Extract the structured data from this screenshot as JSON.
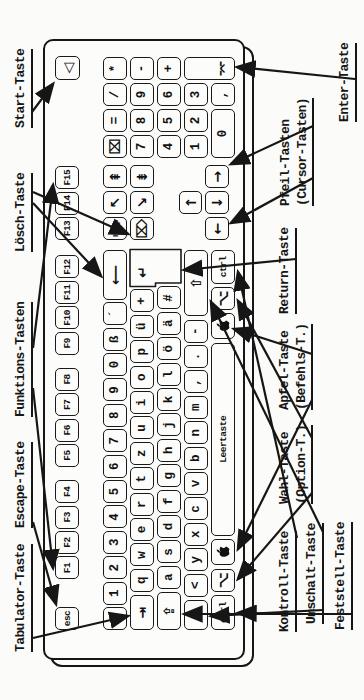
{
  "figure": {
    "kind": "keyboard-diagram",
    "paper_color": "#fbfbf9",
    "ink_color": "#161616"
  },
  "keyboard": {
    "space_label": "Leertaste",
    "keys": [
      {
        "n": "esc",
        "t": "esc",
        "x": 70,
        "y": 55,
        "s": "s"
      },
      {
        "n": "f1",
        "t": "F1",
        "x": 120.5,
        "y": 55,
        "s": "s"
      },
      {
        "n": "f2",
        "t": "F2",
        "x": 145.9,
        "y": 55,
        "s": "s"
      },
      {
        "n": "f3",
        "t": "F3",
        "x": 171.3,
        "y": 55,
        "s": "s"
      },
      {
        "n": "f4",
        "t": "F4",
        "x": 196.7,
        "y": 55,
        "s": "s"
      },
      {
        "n": "f5",
        "t": "F5",
        "x": 232.9,
        "y": 55,
        "s": "s"
      },
      {
        "n": "f6",
        "t": "F6",
        "x": 258.3,
        "y": 55,
        "s": "s"
      },
      {
        "n": "f7",
        "t": "F7",
        "x": 283.7,
        "y": 55,
        "s": "s"
      },
      {
        "n": "f8",
        "t": "F8",
        "x": 309.1,
        "y": 55,
        "s": "s"
      },
      {
        "n": "f9",
        "t": "F9",
        "x": 345.3,
        "y": 55,
        "s": "s"
      },
      {
        "n": "f10",
        "t": "F10",
        "x": 370.7,
        "y": 55,
        "s": "s"
      },
      {
        "n": "f11",
        "t": "F11",
        "x": 396.1,
        "y": 55,
        "s": "s"
      },
      {
        "n": "f12",
        "t": "F12",
        "x": 421.5,
        "y": 55,
        "s": "s"
      },
      {
        "n": "f13",
        "t": "F13",
        "x": 460,
        "y": 55,
        "s": "s"
      },
      {
        "n": "f14",
        "t": "F14",
        "x": 485.4,
        "y": 55,
        "s": "s"
      },
      {
        "n": "f15",
        "t": "F15",
        "x": 510.8,
        "y": 55,
        "s": "s"
      },
      {
        "n": "power",
        "t": "◁",
        "x": 620,
        "y": 55,
        "w": 24,
        "h": 25,
        "s": "l"
      },
      {
        "n": "caret",
        "t": "^",
        "x": 70,
        "y": 103
      },
      {
        "n": "digit-1",
        "t": "1",
        "x": 95.4,
        "y": 103
      },
      {
        "n": "digit-2",
        "t": "2",
        "x": 120.8,
        "y": 103
      },
      {
        "n": "digit-3",
        "t": "3",
        "x": 146.2,
        "y": 103
      },
      {
        "n": "digit-4",
        "t": "4",
        "x": 171.6,
        "y": 103
      },
      {
        "n": "digit-5",
        "t": "5",
        "x": 197,
        "y": 103
      },
      {
        "n": "digit-6",
        "t": "6",
        "x": 222.4,
        "y": 103
      },
      {
        "n": "digit-7",
        "t": "7",
        "x": 247.8,
        "y": 103
      },
      {
        "n": "digit-8",
        "t": "8",
        "x": 273.2,
        "y": 103
      },
      {
        "n": "digit-9",
        "t": "9",
        "x": 298.6,
        "y": 103
      },
      {
        "n": "digit-0",
        "t": "0",
        "x": 324,
        "y": 103
      },
      {
        "n": "eszett",
        "t": "ß",
        "x": 349.4,
        "y": 103
      },
      {
        "n": "acute",
        "t": "´",
        "x": 374.8,
        "y": 103
      },
      {
        "n": "delete-backspace",
        "t": "⟵",
        "x": 400.2,
        "y": 103,
        "w": 50,
        "s": "l"
      },
      {
        "n": "tab",
        "t": "⇥",
        "x": 70,
        "y": 130,
        "w": 35,
        "s": "l"
      },
      {
        "n": "letter-q",
        "t": "q",
        "x": 108.2,
        "y": 130
      },
      {
        "n": "letter-w",
        "t": "w",
        "x": 133.6,
        "y": 130
      },
      {
        "n": "letter-e",
        "t": "e",
        "x": 159,
        "y": 130
      },
      {
        "n": "letter-r",
        "t": "r",
        "x": 184.4,
        "y": 130
      },
      {
        "n": "letter-t",
        "t": "t",
        "x": 209.8,
        "y": 130
      },
      {
        "n": "letter-z",
        "t": "z",
        "x": 235.2,
        "y": 130
      },
      {
        "n": "letter-u",
        "t": "u",
        "x": 260.6,
        "y": 130
      },
      {
        "n": "letter-i",
        "t": "i",
        "x": 286,
        "y": 130
      },
      {
        "n": "letter-o",
        "t": "o",
        "x": 311.4,
        "y": 130
      },
      {
        "n": "letter-p",
        "t": "p",
        "x": 336.8,
        "y": 130
      },
      {
        "n": "umlaut-u",
        "t": "ü",
        "x": 362.2,
        "y": 130
      },
      {
        "n": "plus",
        "t": "+",
        "x": 387.6,
        "y": 130
      },
      {
        "n": "caps-lock",
        "t": "⇪",
        "x": 70,
        "y": 157,
        "w": 38,
        "s": "l"
      },
      {
        "n": "letter-a",
        "t": "a",
        "x": 111.2,
        "y": 157
      },
      {
        "n": "letter-s",
        "t": "s",
        "x": 136.6,
        "y": 157
      },
      {
        "n": "letter-d",
        "t": "d",
        "x": 162,
        "y": 157
      },
      {
        "n": "letter-f",
        "t": "f",
        "x": 187.4,
        "y": 157
      },
      {
        "n": "letter-g",
        "t": "g",
        "x": 212.8,
        "y": 157
      },
      {
        "n": "letter-h",
        "t": "h",
        "x": 238.2,
        "y": 157
      },
      {
        "n": "letter-j",
        "t": "j",
        "x": 263.6,
        "y": 157
      },
      {
        "n": "letter-k",
        "t": "k",
        "x": 289,
        "y": 157
      },
      {
        "n": "letter-l",
        "t": "l",
        "x": 314.4,
        "y": 157
      },
      {
        "n": "umlaut-o",
        "t": "ö",
        "x": 339.8,
        "y": 157
      },
      {
        "n": "umlaut-a",
        "t": "ä",
        "x": 365.2,
        "y": 157
      },
      {
        "n": "hash",
        "t": "#",
        "x": 390.6,
        "y": 157
      },
      {
        "n": "shift-left",
        "t": "⇧",
        "x": 70,
        "y": 184,
        "w": 30,
        "s": "l"
      },
      {
        "n": "less-than",
        "t": "<",
        "x": 103.4,
        "y": 184
      },
      {
        "n": "letter-y",
        "t": "y",
        "x": 128.8,
        "y": 184
      },
      {
        "n": "letter-x",
        "t": "x",
        "x": 154.2,
        "y": 184
      },
      {
        "n": "letter-c",
        "t": "c",
        "x": 179.6,
        "y": 184
      },
      {
        "n": "letter-v",
        "t": "v",
        "x": 205,
        "y": 184
      },
      {
        "n": "letter-b",
        "t": "b",
        "x": 230.4,
        "y": 184
      },
      {
        "n": "letter-n",
        "t": "n",
        "x": 255.8,
        "y": 184
      },
      {
        "n": "letter-m",
        "t": "m",
        "x": 281.2,
        "y": 184
      },
      {
        "n": "comma",
        "t": ",",
        "x": 306.6,
        "y": 184
      },
      {
        "n": "period",
        "t": ".",
        "x": 332,
        "y": 184
      },
      {
        "n": "minus",
        "t": "-",
        "x": 357.4,
        "y": 184
      },
      {
        "n": "shift-right",
        "t": "⇧",
        "x": 383.8,
        "y": 184,
        "w": 66.2,
        "s": "l"
      },
      {
        "n": "ctrl-left",
        "t": "ctrl",
        "x": 70,
        "y": 211,
        "w": 35,
        "s": "s"
      },
      {
        "n": "option-left",
        "t": "⌥",
        "x": 108.4,
        "y": 211,
        "s": "l"
      },
      {
        "n": "cmd-left",
        "icon": "apple",
        "t": "",
        "x": 134.8,
        "y": 211,
        "w": 26
      },
      {
        "n": "space",
        "t": "Leertaste",
        "x": 164.2,
        "y": 211,
        "w": 193,
        "s": "s"
      },
      {
        "n": "cmd-right",
        "icon": "apple",
        "t": "",
        "x": 360.6,
        "y": 211,
        "w": 26
      },
      {
        "n": "option-right",
        "t": "⌥",
        "x": 390,
        "y": 211,
        "s": "l"
      },
      {
        "n": "ctrl-right",
        "t": "ctrl",
        "x": 416.4,
        "y": 211,
        "w": 33.6,
        "s": "s"
      },
      {
        "n": "help",
        "t": "help",
        "x": 460,
        "y": 103,
        "s": "xs"
      },
      {
        "n": "home",
        "t": "↖",
        "x": 486,
        "y": 103,
        "s": "l"
      },
      {
        "n": "page-up",
        "t": "⇞",
        "x": 512,
        "y": 103,
        "s": "l"
      },
      {
        "n": "fwd-delete",
        "t": "⌦",
        "x": 460,
        "y": 130,
        "s": "l"
      },
      {
        "n": "end",
        "t": "↘",
        "x": 486,
        "y": 130,
        "s": "l"
      },
      {
        "n": "page-down",
        "t": "⇟",
        "x": 512,
        "y": 130,
        "s": "l"
      },
      {
        "n": "arrow-up",
        "t": "↑",
        "x": 486,
        "y": 179,
        "h": 23,
        "s": "l"
      },
      {
        "n": "arrow-left",
        "t": "←",
        "x": 460,
        "y": 205,
        "s": "l"
      },
      {
        "n": "arrow-down",
        "t": "↓",
        "x": 486,
        "y": 205,
        "s": "l"
      },
      {
        "n": "arrow-right",
        "t": "→",
        "x": 512,
        "y": 205,
        "s": "l"
      },
      {
        "n": "num-clear",
        "t": "⌧",
        "x": 542,
        "y": 103,
        "s": "l"
      },
      {
        "n": "num-equals",
        "t": "=",
        "x": 568,
        "y": 103
      },
      {
        "n": "num-divide",
        "t": "/",
        "x": 594,
        "y": 103
      },
      {
        "n": "num-multiply",
        "t": "*",
        "x": 620,
        "y": 103
      },
      {
        "n": "num-7",
        "t": "7",
        "x": 542,
        "y": 130
      },
      {
        "n": "num-8",
        "t": "8",
        "x": 568,
        "y": 130
      },
      {
        "n": "num-9",
        "t": "9",
        "x": 594,
        "y": 130
      },
      {
        "n": "num-minus",
        "t": "-",
        "x": 620,
        "y": 130
      },
      {
        "n": "num-4",
        "t": "4",
        "x": 542,
        "y": 157
      },
      {
        "n": "num-5",
        "t": "5",
        "x": 568,
        "y": 157
      },
      {
        "n": "num-6",
        "t": "6",
        "x": 594,
        "y": 157
      },
      {
        "n": "num-plus",
        "t": "+",
        "x": 620,
        "y": 157
      },
      {
        "n": "num-1",
        "t": "1",
        "x": 542,
        "y": 184
      },
      {
        "n": "num-2",
        "t": "2",
        "x": 568,
        "y": 184
      },
      {
        "n": "num-3",
        "t": "3",
        "x": 594,
        "y": 184
      },
      {
        "n": "num-enter",
        "t": "⌤",
        "x": 620,
        "y": 184,
        "h": 51,
        "s": "l",
        "vend": true
      },
      {
        "n": "num-0",
        "t": "0",
        "x": 542,
        "y": 211,
        "w": 49
      },
      {
        "n": "num-comma",
        "t": ",",
        "x": 594,
        "y": 211
      }
    ],
    "return_key": {
      "n": "return",
      "t": "↵",
      "shape": [
        [
          413.5,
          130
        ],
        [
          450.5,
          130
        ],
        [
          450.5,
          181
        ],
        [
          417,
          181
        ],
        [
          417,
          155.5
        ],
        [
          413.5,
          155.5
        ]
      ],
      "glyph_box": [
        417,
        131,
        22,
        22
      ]
    }
  },
  "callouts": {
    "top": [
      {
        "id": "tabulator",
        "lines": [
          "Tabulator-Taste"
        ],
        "x": 48,
        "y": 13
      },
      {
        "id": "escape",
        "lines": [
          "Escape-Taste"
        ],
        "x": 172,
        "y": 13
      },
      {
        "id": "funktions",
        "lines": [
          "Funktions-Tasten"
        ],
        "x": 283,
        "y": 13
      },
      {
        "id": "loesch",
        "lines": [
          "Lösch-Taste"
        ],
        "x": 448,
        "y": 13
      },
      {
        "id": "start",
        "lines": [
          "Start-Taste"
        ],
        "x": 572,
        "y": 13
      }
    ],
    "bottom": [
      {
        "id": "kontroll",
        "lines": [
          "Kontroll-Taste"
        ],
        "x": 68,
        "y": 277
      },
      {
        "id": "umschalt",
        "lines": [
          "Umschalt-Taste"
        ],
        "x": 76,
        "y": 304
      },
      {
        "id": "feststell",
        "lines": [
          "Feststell-Taste"
        ],
        "x": 70,
        "y": 333
      },
      {
        "id": "wahl",
        "lines": [
          "Wahl-Taste",
          "(Option-T.)"
        ],
        "x": 196,
        "y": 277
      },
      {
        "id": "apfel",
        "lines": [
          "Apfel-Taste",
          "(Befehls-T.)"
        ],
        "x": 290,
        "y": 277
      },
      {
        "id": "return",
        "lines": [
          "Return-Taste"
        ],
        "x": 386,
        "y": 277
      },
      {
        "id": "pfeil",
        "lines": [
          "Pfeil-Tasten",
          "(Cursor-Tasten)"
        ],
        "x": 494,
        "y": 278
      },
      {
        "id": "enter",
        "lines": [
          "Enter-Taste"
        ],
        "x": 578,
        "y": 337
      }
    ]
  },
  "arrows": [
    {
      "n": "start-to-power",
      "from": [
        588,
        32
      ],
      "to": [
        616,
        53
      ]
    },
    {
      "n": "escape-to-esc",
      "from": [
        178,
        33
      ],
      "to": [
        96,
        56
      ]
    },
    {
      "n": "tabulator-to-tab",
      "from": [
        62,
        33
      ],
      "to": [
        84,
        128
      ]
    },
    {
      "n": "funktions-to-f1",
      "from": [
        312,
        33
      ],
      "to": [
        132,
        53
      ]
    },
    {
      "n": "funktions-to-f15",
      "from": [
        352,
        33
      ],
      "to": [
        515,
        53
      ]
    },
    {
      "n": "loesch-to-delete",
      "from": [
        497,
        33
      ],
      "to": [
        424,
        101
      ]
    },
    {
      "n": "loesch-to-fwddel",
      "from": [
        508,
        33
      ],
      "to": [
        466,
        128
      ]
    },
    {
      "n": "kontroll-to-lctrl",
      "from": [
        86,
        297
      ],
      "to": [
        87,
        238
      ]
    },
    {
      "n": "kontroll-to-rctrl",
      "from": [
        162,
        297
      ],
      "to": [
        428,
        238
      ]
    },
    {
      "n": "umschalt-to-lshift",
      "from": [
        90,
        323
      ],
      "to": [
        84,
        211
      ]
    },
    {
      "n": "umschalt-to-rshift",
      "from": [
        168,
        323
      ],
      "to": [
        398,
        211
      ]
    },
    {
      "n": "feststell-to-caps",
      "from": [
        86,
        352
      ],
      "to": [
        86,
        184
      ]
    },
    {
      "n": "wahl-to-lopt",
      "from": [
        207,
        312
      ],
      "to": [
        121,
        238
      ]
    },
    {
      "n": "wahl-to-ropt",
      "from": [
        262,
        312
      ],
      "to": [
        399,
        238
      ]
    },
    {
      "n": "apfel-to-lcmd",
      "from": [
        300,
        312
      ],
      "to": [
        151,
        238
      ]
    },
    {
      "n": "apfel-to-rcmd",
      "from": [
        346,
        312
      ],
      "to": [
        371,
        234
      ]
    },
    {
      "n": "returnlabel-to-return",
      "from": [
        441,
        296
      ],
      "to": [
        430,
        184
      ]
    },
    {
      "n": "pfeil-to-arrows-a",
      "from": [
        522,
        313
      ],
      "to": [
        477,
        231
      ]
    },
    {
      "n": "pfeil-to-arrows-b",
      "from": [
        574,
        313
      ],
      "to": [
        536,
        231
      ]
    },
    {
      "n": "enterlabel-to-enter",
      "from": [
        621,
        355
      ],
      "to": [
        633,
        237
      ]
    }
  ],
  "icons": {
    "apple": "apple-logo"
  }
}
